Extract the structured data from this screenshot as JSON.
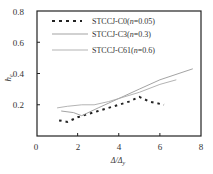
{
  "chart_data": {
    "type": "line",
    "title": "",
    "xlabel": "Δ/Δy",
    "ylabel": "he",
    "xlim": [
      0,
      8
    ],
    "ylim": [
      0,
      0.8
    ],
    "xticks": [
      0,
      2,
      4,
      6,
      8
    ],
    "yticks": [
      0.2,
      0.4,
      0.6,
      0.8
    ],
    "grid": false,
    "legend_position": "upper left",
    "series": [
      {
        "name": "STCCJ-C0(n=0.05)",
        "style": "dotted",
        "color": "#222222",
        "x": [
          1.1,
          1.5,
          2.0,
          2.5,
          3.0,
          3.5,
          4.0,
          4.5,
          5.0,
          5.5,
          6.2
        ],
        "y": [
          0.1,
          0.09,
          0.12,
          0.14,
          0.16,
          0.18,
          0.2,
          0.22,
          0.25,
          0.22,
          0.2
        ]
      },
      {
        "name": "STCCJ-C3(n=0.3)",
        "style": "solid",
        "color": "#999999",
        "x": [
          1.2,
          1.8,
          2.2,
          3.0,
          4.0,
          5.0,
          6.0,
          7.6
        ],
        "y": [
          0.16,
          0.15,
          0.13,
          0.18,
          0.24,
          0.3,
          0.36,
          0.43
        ]
      },
      {
        "name": "STCCJ-C61(n=0.6)",
        "style": "solid",
        "color": "#aaaaaa",
        "x": [
          1.0,
          1.5,
          2.2,
          2.8,
          3.5,
          4.0,
          5.0,
          6.0,
          6.8
        ],
        "y": [
          0.18,
          0.19,
          0.2,
          0.2,
          0.22,
          0.24,
          0.28,
          0.33,
          0.36
        ]
      }
    ]
  },
  "axes": {
    "x_tick_labels": [
      "0",
      "2",
      "4",
      "6",
      "8"
    ],
    "y_tick_labels": [
      "0.2",
      "0.4",
      "0.6",
      "0.8"
    ],
    "xlabel": "Δ/Δ",
    "xlabel_sub": "y",
    "ylabel": "h",
    "ylabel_sub": "e"
  },
  "legend": [
    {
      "prefix": "STCCJ-C0(",
      "var": "n",
      "suffix": "=0.05)"
    },
    {
      "prefix": "STCCJ-C3(",
      "var": "n",
      "suffix": "=0.3)"
    },
    {
      "prefix": "STCCJ-C61(",
      "var": "n",
      "suffix": "=0.6)"
    }
  ]
}
